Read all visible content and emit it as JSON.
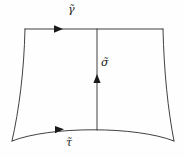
{
  "figure": {
    "kind": "mathematical-diagram",
    "background_color": "#fefefe",
    "stroke_color": "#2b2b2b",
    "label_color": "#1a1a1a"
  },
  "labels": {
    "top": "γ̃",
    "middle": "σ̃",
    "bottom": "τ̃"
  },
  "edges": [
    {
      "id": "top",
      "label": "γ̃",
      "direction": "right",
      "shape": "straight",
      "arrow_position_x": 60,
      "arrow_position_y": 29
    },
    {
      "id": "middle",
      "label": "σ̃",
      "direction": "up",
      "shape": "straight",
      "arrow_position_x": 97,
      "arrow_position_y": 78
    },
    {
      "id": "bottom",
      "label": "τ̃",
      "direction": "right",
      "shape": "curved",
      "arrow_position_x": 60,
      "arrow_position_y": 130
    },
    {
      "id": "left",
      "label": "",
      "direction": "none",
      "shape": "curved",
      "arrow_position_x": null,
      "arrow_position_y": null
    },
    {
      "id": "right",
      "label": "",
      "direction": "none",
      "shape": "curved",
      "arrow_position_x": null,
      "arrow_position_y": null
    }
  ],
  "vertices": {
    "top_left": {
      "x": 25,
      "y": 29
    },
    "top_right": {
      "x": 163,
      "y": 29
    },
    "bottom_left": {
      "x": 12,
      "y": 141
    },
    "bottom_right": {
      "x": 174,
      "y": 141
    },
    "top_mid": {
      "x": 97,
      "y": 29
    },
    "bottom_mid": {
      "x": 97,
      "y": 130
    }
  }
}
